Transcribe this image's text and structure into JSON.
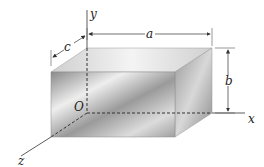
{
  "diagram": {
    "type": "3d-rectangular-box",
    "labels": {
      "y_axis": "y",
      "x_axis": "x",
      "z_axis": "z",
      "origin": "O",
      "dim_a": "a",
      "dim_b": "b",
      "dim_c": "c"
    },
    "colors": {
      "line": "#333333",
      "face_light": "#f2f2f2",
      "face_dark": "#7a7a7a"
    }
  }
}
